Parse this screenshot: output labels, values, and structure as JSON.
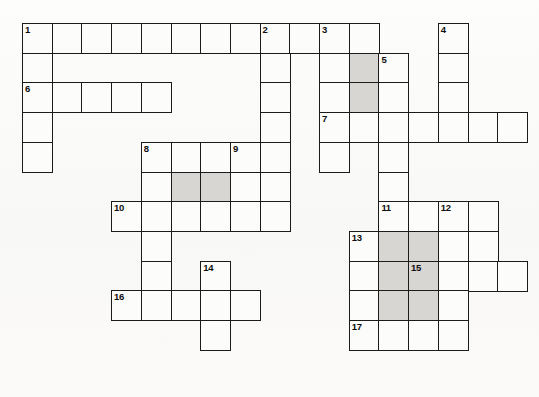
{
  "puzzle": {
    "title": "Crossword Grid",
    "type": "crossword",
    "cell_size": 29.7,
    "origin_x": 22,
    "origin_y": 23,
    "colors": {
      "cell_fill": "#fcfcfa",
      "shaded_fill": "#d7d6d2",
      "border": "#1b1b1b",
      "page_background": "#fbfbf9",
      "number_text": "#0d0d0d"
    },
    "counts": {
      "total_cells": 96,
      "shaded_cells": 12,
      "clue_numbers": 17
    },
    "cells": [
      {
        "c": 0,
        "r": 0,
        "shaded": false,
        "num": "1"
      },
      {
        "c": 1,
        "r": 0,
        "shaded": false,
        "num": ""
      },
      {
        "c": 2,
        "r": 0,
        "shaded": false,
        "num": ""
      },
      {
        "c": 3,
        "r": 0,
        "shaded": false,
        "num": ""
      },
      {
        "c": 4,
        "r": 0,
        "shaded": false,
        "num": ""
      },
      {
        "c": 5,
        "r": 0,
        "shaded": false,
        "num": ""
      },
      {
        "c": 6,
        "r": 0,
        "shaded": false,
        "num": ""
      },
      {
        "c": 7,
        "r": 0,
        "shaded": false,
        "num": ""
      },
      {
        "c": 8,
        "r": 0,
        "shaded": false,
        "num": "2"
      },
      {
        "c": 9,
        "r": 0,
        "shaded": false,
        "num": ""
      },
      {
        "c": 10,
        "r": 0,
        "shaded": false,
        "num": "3"
      },
      {
        "c": 11,
        "r": 0,
        "shaded": false,
        "num": ""
      },
      {
        "c": 14,
        "r": 0,
        "shaded": false,
        "num": "4"
      },
      {
        "c": 0,
        "r": 1,
        "shaded": false,
        "num": ""
      },
      {
        "c": 8,
        "r": 1,
        "shaded": false,
        "num": ""
      },
      {
        "c": 10,
        "r": 1,
        "shaded": false,
        "num": ""
      },
      {
        "c": 11,
        "r": 1,
        "shaded": true,
        "num": ""
      },
      {
        "c": 12,
        "r": 1,
        "shaded": false,
        "num": "5"
      },
      {
        "c": 14,
        "r": 1,
        "shaded": false,
        "num": ""
      },
      {
        "c": 0,
        "r": 2,
        "shaded": false,
        "num": "6"
      },
      {
        "c": 1,
        "r": 2,
        "shaded": false,
        "num": ""
      },
      {
        "c": 2,
        "r": 2,
        "shaded": false,
        "num": ""
      },
      {
        "c": 3,
        "r": 2,
        "shaded": false,
        "num": ""
      },
      {
        "c": 4,
        "r": 2,
        "shaded": false,
        "num": ""
      },
      {
        "c": 8,
        "r": 2,
        "shaded": false,
        "num": ""
      },
      {
        "c": 10,
        "r": 2,
        "shaded": false,
        "num": ""
      },
      {
        "c": 11,
        "r": 2,
        "shaded": true,
        "num": ""
      },
      {
        "c": 12,
        "r": 2,
        "shaded": false,
        "num": ""
      },
      {
        "c": 14,
        "r": 2,
        "shaded": false,
        "num": ""
      },
      {
        "c": 0,
        "r": 3,
        "shaded": false,
        "num": ""
      },
      {
        "c": 8,
        "r": 3,
        "shaded": false,
        "num": ""
      },
      {
        "c": 10,
        "r": 3,
        "shaded": false,
        "num": "7"
      },
      {
        "c": 11,
        "r": 3,
        "shaded": false,
        "num": ""
      },
      {
        "c": 12,
        "r": 3,
        "shaded": false,
        "num": ""
      },
      {
        "c": 13,
        "r": 3,
        "shaded": false,
        "num": ""
      },
      {
        "c": 14,
        "r": 3,
        "shaded": false,
        "num": ""
      },
      {
        "c": 15,
        "r": 3,
        "shaded": false,
        "num": ""
      },
      {
        "c": 16,
        "r": 3,
        "shaded": false,
        "num": ""
      },
      {
        "c": 0,
        "r": 4,
        "shaded": false,
        "num": ""
      },
      {
        "c": 4,
        "r": 4,
        "shaded": false,
        "num": "8"
      },
      {
        "c": 5,
        "r": 4,
        "shaded": false,
        "num": ""
      },
      {
        "c": 6,
        "r": 4,
        "shaded": false,
        "num": ""
      },
      {
        "c": 7,
        "r": 4,
        "shaded": false,
        "num": "9"
      },
      {
        "c": 8,
        "r": 4,
        "shaded": false,
        "num": ""
      },
      {
        "c": 10,
        "r": 4,
        "shaded": false,
        "num": ""
      },
      {
        "c": 12,
        "r": 4,
        "shaded": false,
        "num": ""
      },
      {
        "c": 4,
        "r": 5,
        "shaded": false,
        "num": ""
      },
      {
        "c": 5,
        "r": 5,
        "shaded": true,
        "num": ""
      },
      {
        "c": 6,
        "r": 5,
        "shaded": true,
        "num": ""
      },
      {
        "c": 7,
        "r": 5,
        "shaded": false,
        "num": ""
      },
      {
        "c": 8,
        "r": 5,
        "shaded": false,
        "num": ""
      },
      {
        "c": 12,
        "r": 5,
        "shaded": false,
        "num": ""
      },
      {
        "c": 3,
        "r": 6,
        "shaded": false,
        "num": "10"
      },
      {
        "c": 4,
        "r": 6,
        "shaded": false,
        "num": ""
      },
      {
        "c": 5,
        "r": 6,
        "shaded": false,
        "num": ""
      },
      {
        "c": 6,
        "r": 6,
        "shaded": false,
        "num": ""
      },
      {
        "c": 7,
        "r": 6,
        "shaded": false,
        "num": ""
      },
      {
        "c": 8,
        "r": 6,
        "shaded": false,
        "num": ""
      },
      {
        "c": 12,
        "r": 6,
        "shaded": false,
        "num": "11"
      },
      {
        "c": 13,
        "r": 6,
        "shaded": false,
        "num": ""
      },
      {
        "c": 14,
        "r": 6,
        "shaded": false,
        "num": "12"
      },
      {
        "c": 15,
        "r": 6,
        "shaded": false,
        "num": ""
      },
      {
        "c": 4,
        "r": 7,
        "shaded": false,
        "num": ""
      },
      {
        "c": 11,
        "r": 7,
        "shaded": false,
        "num": "13"
      },
      {
        "c": 12,
        "r": 7,
        "shaded": true,
        "num": ""
      },
      {
        "c": 13,
        "r": 7,
        "shaded": true,
        "num": ""
      },
      {
        "c": 14,
        "r": 7,
        "shaded": false,
        "num": ""
      },
      {
        "c": 15,
        "r": 7,
        "shaded": false,
        "num": ""
      },
      {
        "c": 4,
        "r": 8,
        "shaded": false,
        "num": ""
      },
      {
        "c": 6,
        "r": 8,
        "shaded": false,
        "num": "14"
      },
      {
        "c": 11,
        "r": 8,
        "shaded": false,
        "num": ""
      },
      {
        "c": 12,
        "r": 8,
        "shaded": true,
        "num": ""
      },
      {
        "c": 13,
        "r": 8,
        "shaded": true,
        "num": "15"
      },
      {
        "c": 14,
        "r": 8,
        "shaded": false,
        "num": ""
      },
      {
        "c": 15,
        "r": 8,
        "shaded": false,
        "num": ""
      },
      {
        "c": 16,
        "r": 8,
        "shaded": false,
        "num": ""
      },
      {
        "c": 3,
        "r": 9,
        "shaded": false,
        "num": "16"
      },
      {
        "c": 4,
        "r": 9,
        "shaded": false,
        "num": ""
      },
      {
        "c": 5,
        "r": 9,
        "shaded": false,
        "num": ""
      },
      {
        "c": 6,
        "r": 9,
        "shaded": false,
        "num": ""
      },
      {
        "c": 7,
        "r": 9,
        "shaded": false,
        "num": ""
      },
      {
        "c": 11,
        "r": 9,
        "shaded": false,
        "num": ""
      },
      {
        "c": 12,
        "r": 9,
        "shaded": true,
        "num": ""
      },
      {
        "c": 13,
        "r": 9,
        "shaded": true,
        "num": ""
      },
      {
        "c": 14,
        "r": 9,
        "shaded": false,
        "num": ""
      },
      {
        "c": 6,
        "r": 10,
        "shaded": false,
        "num": ""
      },
      {
        "c": 11,
        "r": 10,
        "shaded": false,
        "num": "17"
      },
      {
        "c": 12,
        "r": 10,
        "shaded": false,
        "num": ""
      },
      {
        "c": 13,
        "r": 10,
        "shaded": false,
        "num": ""
      },
      {
        "c": 14,
        "r": 10,
        "shaded": false,
        "num": ""
      }
    ]
  }
}
